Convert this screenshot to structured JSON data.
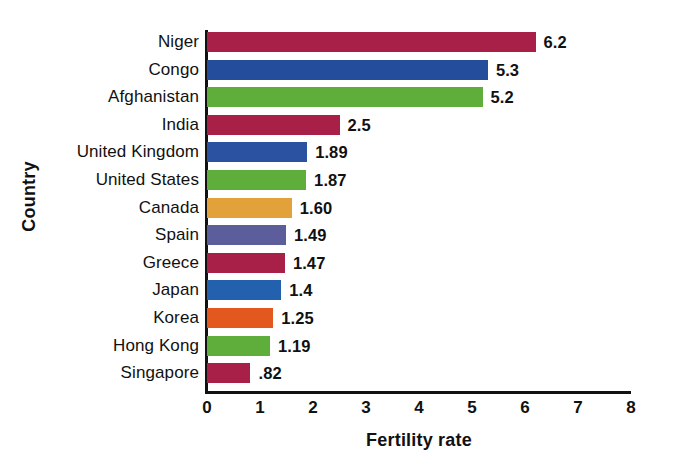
{
  "chart_data": {
    "type": "bar",
    "orientation": "horizontal",
    "title": "",
    "xlabel": "Fertility rate",
    "ylabel": "Country",
    "xlim": [
      0,
      8
    ],
    "xticks": [
      "0",
      "1",
      "2",
      "3",
      "4",
      "5",
      "6",
      "7",
      "8"
    ],
    "grid": false,
    "legend": null,
    "categories": [
      "Niger",
      "Congo",
      "Afghanistan",
      "India",
      "United Kingdom",
      "United States",
      "Canada",
      "Spain",
      "Greece",
      "Japan",
      "Korea",
      "Hong Kong",
      "Singapore"
    ],
    "values": [
      6.2,
      5.3,
      5.2,
      2.5,
      1.89,
      1.87,
      1.6,
      1.49,
      1.47,
      1.4,
      1.25,
      1.19,
      0.82
    ],
    "value_labels": [
      "6.2",
      "5.3",
      "5.2",
      "2.5",
      "1.89",
      "1.87",
      "1.60",
      "1.49",
      "1.47",
      "1.4",
      "1.25",
      "1.19",
      ".82"
    ],
    "bar_colors": [
      "#A82048",
      "#244E9C",
      "#5FAE3C",
      "#A82048",
      "#2A52A0",
      "#5FAE3C",
      "#E2A13A",
      "#5B5E9B",
      "#A82048",
      "#2361AE",
      "#E2581E",
      "#5FAE3C",
      "#A82048"
    ]
  }
}
